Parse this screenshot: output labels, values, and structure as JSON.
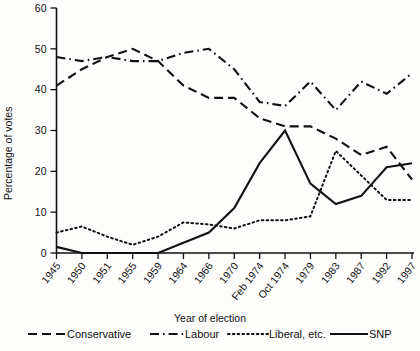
{
  "chart_data": {
    "type": "line",
    "title": "",
    "xlabel": "Year of election",
    "ylabel": "Percentage of votes",
    "ylim": [
      0,
      60
    ],
    "yticks": [
      0,
      10,
      20,
      30,
      40,
      50,
      60
    ],
    "grid": false,
    "legend_position": "bottom",
    "categories": [
      "1945",
      "1950",
      "1951",
      "1955",
      "1959",
      "1964",
      "1966",
      "1970",
      "Feb 1974",
      "Oct 1974",
      "1979",
      "1983",
      "1987",
      "1992",
      "1997"
    ],
    "series": [
      {
        "name": "Conservative",
        "style": "dashed",
        "values": [
          41,
          45,
          48,
          50,
          47,
          41,
          38,
          38,
          33,
          31,
          31,
          28,
          24,
          26,
          18
        ]
      },
      {
        "name": "Labour",
        "style": "dash-dot",
        "values": [
          48,
          47,
          48,
          47,
          47,
          49,
          50,
          45,
          37,
          36,
          42,
          35,
          42,
          39,
          44
        ]
      },
      {
        "name": "Liberal, etc.",
        "style": "dotted",
        "values": [
          5,
          6.5,
          4,
          2,
          4,
          7.5,
          7,
          6,
          8,
          8,
          9,
          25,
          19,
          13,
          13
        ]
      },
      {
        "name": "SNP",
        "style": "solid",
        "values": [
          1.5,
          0,
          0,
          0,
          0,
          2.5,
          5,
          11,
          22,
          30,
          17,
          12,
          14,
          21,
          22
        ]
      }
    ]
  },
  "legend": {
    "items": [
      {
        "label": "Conservative",
        "style": "dashed"
      },
      {
        "label": "Labour",
        "style": "dash-dot"
      },
      {
        "label": "Liberal, etc.",
        "style": "dotted"
      },
      {
        "label": "SNP",
        "style": "solid"
      }
    ]
  },
  "axes": {
    "y_title": "Percentage of votes",
    "x_title": "Year of election",
    "y_tick_labels": [
      "60",
      "50",
      "40",
      "30",
      "20",
      "10",
      "0"
    ],
    "x_tick_labels": [
      "1945",
      "1950",
      "1951",
      "1955",
      "1959",
      "1964",
      "1966",
      "1970",
      "Feb 1974",
      "Oct 1974",
      "1979",
      "1983",
      "1987",
      "1992",
      "1997"
    ]
  },
  "colors": {
    "ink": "#111111",
    "background": "#fdfdfc"
  }
}
